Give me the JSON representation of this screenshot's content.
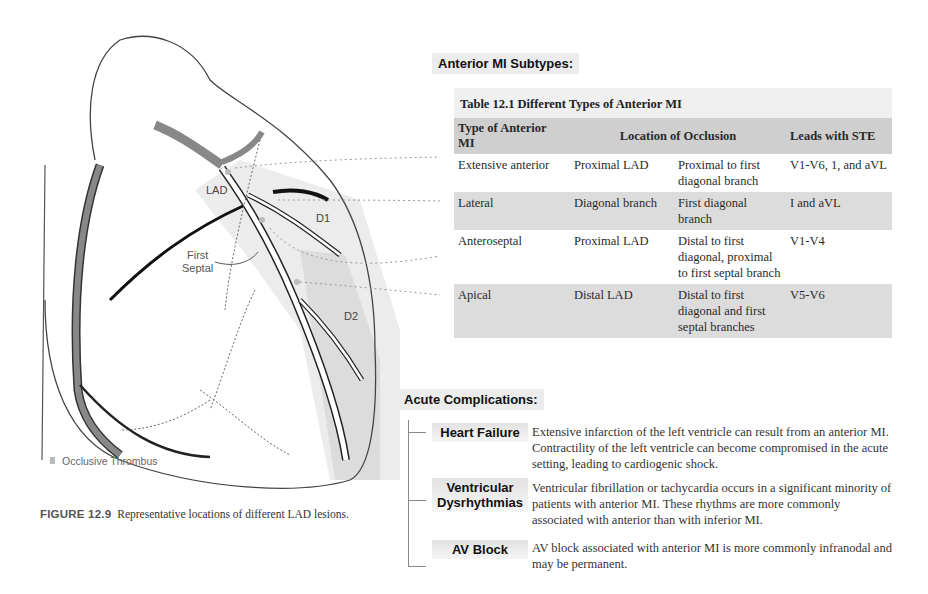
{
  "figure": {
    "labels": {
      "lad": "LAD",
      "d1": "D1",
      "d2": "D2",
      "first_septal_line1": "First",
      "first_septal_line2": "Septal"
    },
    "legend": "Occlusive Thrombus",
    "caption_number": "FIGURE 12.9",
    "caption_text": "Representative locations of different LAD lesions."
  },
  "subtypes": {
    "heading": "Anterior MI Subtypes:",
    "table_title": "Table 12.1  Different Types of Anterior MI",
    "headers": [
      "Type of Anterior MI",
      "Location of Occlusion",
      "Leads with STE"
    ],
    "rows": [
      {
        "type": "Extensive anterior",
        "vessel": "Proximal LAD",
        "location": "Proximal to first diagonal branch",
        "leads": "V1-V6, 1, and aVL"
      },
      {
        "type": "Lateral",
        "vessel": "Diagonal branch",
        "location": "First diagonal branch",
        "leads": "I and aVL"
      },
      {
        "type": "Anteroseptal",
        "vessel": "Proximal LAD",
        "location": "Distal to first diagonal, proximal to first septal branch",
        "leads": "V1-V4"
      },
      {
        "type": "Apical",
        "vessel": "Distal LAD",
        "location": "Distal to first diagonal and first septal branches",
        "leads": "V5-V6"
      }
    ]
  },
  "complications": {
    "heading": "Acute Complications:",
    "items": [
      {
        "label": "Heart Failure",
        "text": "Extensive infarction of the left ventricle can result from an anterior MI. Contractility of the left ventricle can become compromised in the acute setting, leading to cardiogenic shock."
      },
      {
        "label_line1": "Ventricular",
        "label_line2": "Dysrhythmias",
        "text": "Ventricular fibrillation or tachycardia occurs in a significant minority of patients with anterior MI. These rhythms are more commonly associated with anterior than with inferior MI."
      },
      {
        "label": "AV Block",
        "text": "AV block associated with anterior MI is more commonly infranodal and may be permanent."
      }
    ]
  }
}
